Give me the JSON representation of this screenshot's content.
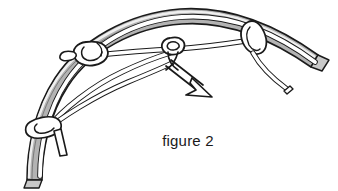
{
  "figure": {
    "caption": "figure 2",
    "title": "figure 2",
    "background_color": "#ffffff",
    "line_color": "#1a1a1a",
    "strap_fill": "#b3b3b3",
    "strap_highlight": "#e8e8e8",
    "cord_fill": "#ffffff",
    "caption_color": "#1a1a1a"
  },
  "elements": {
    "strap": {
      "name": "gray arched strap",
      "color": "#b3b3b3",
      "outline": "#1a1a1a"
    },
    "cord": {
      "name": "white lacing cord",
      "color": "#ffffff",
      "outline": "#1a1a1a"
    },
    "knots": [
      {
        "id": "left",
        "label": "left knot",
        "x": 95,
        "y": 52
      },
      {
        "id": "middle",
        "label": "middle knot",
        "x": 174,
        "y": 50
      },
      {
        "id": "right",
        "label": "right knot",
        "x": 253,
        "y": 38
      },
      {
        "id": "lower-left",
        "label": "lower left knot",
        "x": 42,
        "y": 125
      }
    ],
    "arrow": {
      "name": "pull direction arrow",
      "label": "pull direction",
      "from_x": 168,
      "from_y": 62,
      "to_x": 207,
      "to_y": 97,
      "style": "open arrowhead"
    },
    "tails": [
      {
        "id": "lower-left-tail",
        "label": "short cord tail at lower left knot"
      },
      {
        "id": "right-tail",
        "label": "cord tail at right knot"
      },
      {
        "id": "strap-end-left",
        "label": "cut strap end lower left"
      },
      {
        "id": "strap-end-right",
        "label": "cut strap end right"
      }
    ]
  }
}
